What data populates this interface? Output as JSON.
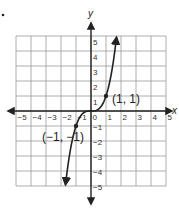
{
  "bullet": "•",
  "chart_data": {
    "type": "line",
    "title": "",
    "xlabel": "x",
    "ylabel": "y",
    "xlim": [
      -5,
      5
    ],
    "ylim": [
      -5,
      5
    ],
    "grid": true,
    "x_ticks": [
      "-5",
      "-4",
      "-3",
      "-2",
      "-1",
      "0",
      "1",
      "2",
      "3",
      "4",
      "5"
    ],
    "y_ticks": [
      "5",
      "4",
      "3",
      "2",
      "1",
      "-1",
      "-2",
      "-3",
      "-4",
      "-5"
    ],
    "series": [
      {
        "name": "y = x^3",
        "function": "x^3",
        "x_range": [
          -1.7,
          1.7
        ],
        "arrows": "both",
        "x": [
          -1.7,
          -1.5,
          -1.25,
          -1,
          -0.75,
          -0.5,
          -0.25,
          0,
          0.25,
          0.5,
          0.75,
          1,
          1.25,
          1.5,
          1.7
        ],
        "y": [
          -4.91,
          -3.38,
          -1.95,
          -1,
          -0.42,
          -0.13,
          -0.02,
          0,
          0.02,
          0.13,
          0.42,
          1,
          1.95,
          3.38,
          4.91
        ]
      }
    ],
    "points": [
      {
        "x": 1,
        "y": 1,
        "label": "(1, 1)"
      },
      {
        "x": -1,
        "y": -1,
        "label": "(−1, −1)"
      }
    ]
  }
}
